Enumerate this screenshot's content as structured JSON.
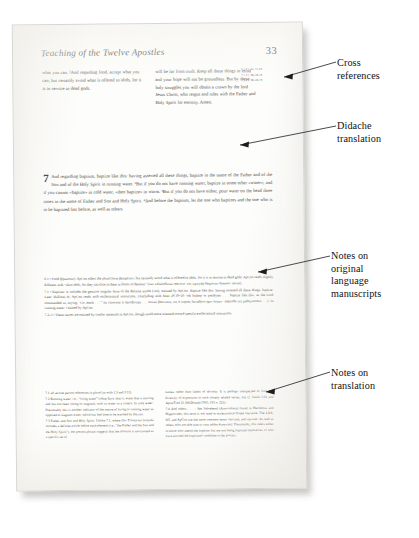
{
  "page": {
    "running_head": "Teaching of the Twelve Apostles",
    "folio": "33"
  },
  "columns": {
    "left": "what you can. ²And regarding food, accept what you can; but certainly avoid what is offered to idols, for it is in service to dead gods.",
    "right": "will be far from truth. Keep all these things in mind and your hope will not be groundless. But by these holy struggles you will obtain a crown by the lord Jesus Christ, who reigns and rules with the Father and Holy Spirit for eternity. Amen."
  },
  "cross_references": [
    "6.3 Cf. Ac 15.29",
    "7.1 Cf. Mt 28.19",
    "7.3 Cf. Mt 28.19"
  ],
  "chapter": {
    "number": "7",
    "text": "And regarding baptism, baptize like this: having asserted all these things, baptize in the name of the Father and of the Son and of the Holy Spirit in running water. ²But if you do not have running water, baptize in some other «water»; and if you cannot «baptize» in cold water, «then baptize» in warm. ³But if you do not have either, pour water on the head three times in the name of Father and Son and Holy Spirit. ⁴And before the baptism, let the one who baptizes and the one who is to be baptized fast before, as well as others"
  },
  "textual_notes": [
    "6.3 • Food (βρωσεως). ApCon offers the plural form βρωματων, but certainly avoid what is offered to idols, for it is in service to dead gods: ApCon reads slightly different with “shun idols, for they sacrifice to them in honor of demons” (των ειδωλοθυτων φαινετε· επι τιμη γαρ δαιμονων θυουσιν ταυτα).",
    "7.1 • Baptism: It includes the genitive singular form of the definite article (του), omitted by ApCon. Baptize like this: having asserted all these things, baptize: Later Bullions H; ApCon reads with ecclesiastical instruction, concluding with Matt 28.19–20 “oh bishop or presbyter . . . baptize like this, as the Lord commanded us, saying, ‘Go, teach . . .’” (ω επισκοπε η πρεσβυτερε . . . ουτως βαπτισεις, ως ο κυριος διεταξατο ημιν λεγων· πορευθεντες μαθητευσατε . . .). In running water: Omitted by ApCon.",
    "7.2–3 • These verses are omitted by similar materials in ApCon, though much more oriented toward specific ecclesiastical instruction."
  ],
  "translation_notes": {
    "left": [
      "7.1 all second person references in plural (as with 1.3 and 3.11).",
      "7.2 Running water: i.e., “living water” (υδωρ ζων). that is, water that is moving and has not been sitting or stagnant, such as water in a cistern. In cold water: Presumably this is another indicator of the nature of living or running water as opposed to stagnant water, which has had time to be warmed by the sun.",
      "7.3 Father and Son and Holy Spirit: Unlike 7.1, where this Trinitarian formula includes a definite article before each element (i.e., “the Father and the Son and the Holy Spirit”), the present phrase suggests that the formula is envisioned as a specific set of"
    ],
    "right": [
      "names rather than labels of divinity. It is perhaps unexpected to find this diversity of expression in such closely related verses, but cf. Justin 1.61 and ApostTrad 21 (McDonald 1965, 191 n. 222).",
      "7.4 And others . . . : See Sabrehend (Αποστολικη) found in Herodotus and Hippocrates, this term is not used in ecclesiastical Greek literature. The LXX, NT, and ApCon use the more common terms νηστειας and νηστεια. As well as others who are able (και ει τινες αλλοι δυνανται): Presumably, this refers either to those who attend the baptism but are not being baptized themselves or who have assisted the baptismal candidate in the process."
    ]
  },
  "annotations": [
    {
      "id": "cross",
      "label": "Cross\nreferences"
    },
    {
      "id": "didache",
      "label": "Didache\ntranslation"
    },
    {
      "id": "orig",
      "label": "Notes on\noriginal\nlanguage\nmanuscripts"
    },
    {
      "id": "trans",
      "label": "Notes on\ntranslation"
    }
  ]
}
